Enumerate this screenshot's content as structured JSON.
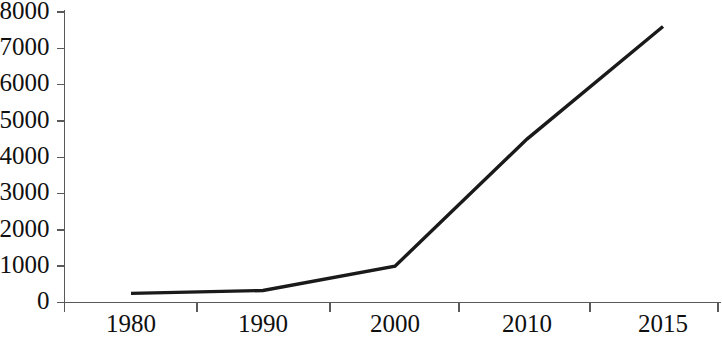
{
  "chart_data": {
    "type": "line",
    "title": "",
    "subtitle": "",
    "xlabel": "",
    "ylabel": "",
    "categories": [
      "1980",
      "1990",
      "2000",
      "2010",
      "2015"
    ],
    "series": [
      {
        "name": "",
        "values": [
          250,
          330,
          1000,
          4500,
          7600
        ]
      }
    ],
    "ylim": [
      0,
      8000
    ],
    "y_ticks": [
      0,
      1000,
      2000,
      3000,
      4000,
      5000,
      6000,
      7000,
      8000
    ],
    "y_tick_labels": [
      "0",
      "1000",
      "2000",
      "3000",
      "4000",
      "5000",
      "6000",
      "7000",
      "8000"
    ],
    "x_tick_labels": [
      "1980",
      "1990",
      "2000",
      "2010",
      "2015"
    ],
    "grid": false,
    "legend": false,
    "legend_position": "none",
    "annotations": [],
    "colors": {
      "series_line": "#1a1a1a",
      "axis": "#595959",
      "text": "#101010",
      "background": "#ffffff"
    }
  }
}
